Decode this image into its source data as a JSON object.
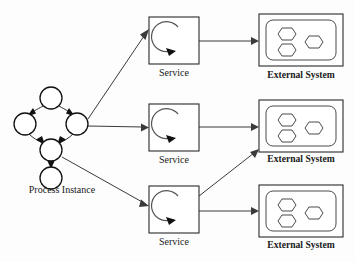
{
  "diagram": {
    "background_color": "#fdfdfd",
    "line_color": "#3a3a3a",
    "text_color": "#1a1a1a",
    "process_instance": {
      "label": "Process Instance",
      "node_count": 5,
      "nodes": [
        {
          "id": "pi-top",
          "cx": 51,
          "cy": 98,
          "r": 11
        },
        {
          "id": "pi-left",
          "cx": 25,
          "cy": 124,
          "r": 11
        },
        {
          "id": "pi-right",
          "cx": 77,
          "cy": 124,
          "r": 11
        },
        {
          "id": "pi-bottom",
          "cx": 51,
          "cy": 150,
          "r": 11
        },
        {
          "id": "pi-end",
          "cx": 51,
          "cy": 178,
          "r": 11
        }
      ],
      "edges": [
        {
          "from": "pi-top",
          "to": "pi-left"
        },
        {
          "from": "pi-top",
          "to": "pi-right"
        },
        {
          "from": "pi-left",
          "to": "pi-bottom"
        },
        {
          "from": "pi-right",
          "to": "pi-bottom"
        },
        {
          "from": "pi-bottom",
          "to": "pi-end"
        }
      ]
    },
    "services": [
      {
        "id": "service-1",
        "label": "Service",
        "x": 149,
        "y": 17,
        "w": 50,
        "h": 47
      },
      {
        "id": "service-2",
        "label": "Service",
        "x": 149,
        "y": 104,
        "w": 50,
        "h": 47
      },
      {
        "id": "service-3",
        "label": "Service",
        "x": 149,
        "y": 186,
        "w": 50,
        "h": 47
      }
    ],
    "external_systems": [
      {
        "id": "external-system-1",
        "label": "External System",
        "x": 259,
        "y": 14,
        "w": 84,
        "h": 52,
        "component_count": 3
      },
      {
        "id": "external-system-2",
        "label": "External System",
        "x": 259,
        "y": 100,
        "w": 84,
        "h": 52,
        "component_count": 3
      },
      {
        "id": "external-system-3",
        "label": "External System",
        "x": 259,
        "y": 185,
        "w": 84,
        "h": 52,
        "component_count": 3
      }
    ],
    "connections": [
      {
        "id": "conn-pi-service-1",
        "from": "process-instance",
        "to": "service-1"
      },
      {
        "id": "conn-pi-service-2",
        "from": "process-instance",
        "to": "service-2"
      },
      {
        "id": "conn-pi-service-3",
        "from": "process-instance",
        "to": "service-3"
      },
      {
        "id": "conn-service-1-external-1",
        "from": "service-1",
        "to": "external-system-1"
      },
      {
        "id": "conn-service-2-external-2",
        "from": "service-2",
        "to": "external-system-2"
      },
      {
        "id": "conn-service-3-external-2",
        "from": "service-3",
        "to": "external-system-2"
      },
      {
        "id": "conn-service-3-external-3",
        "from": "service-3",
        "to": "external-system-3"
      }
    ]
  }
}
